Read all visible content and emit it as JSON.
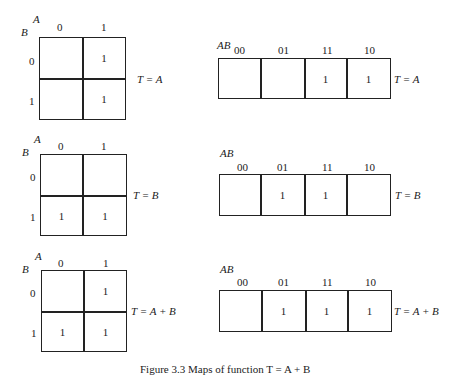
{
  "maps": [
    {
      "function": "T = A",
      "two_by_two": {
        "row_var": "B",
        "col_var": "A",
        "col_labels": [
          "0",
          "1"
        ],
        "row_labels": [
          "0",
          "1"
        ],
        "cells": [
          [
            "",
            "1"
          ],
          [
            "",
            "1"
          ]
        ]
      },
      "one_by_four": {
        "var_label": "AB",
        "col_labels": [
          "00",
          "01",
          "11",
          "10"
        ],
        "cells": [
          "",
          "",
          "1",
          "1"
        ]
      }
    },
    {
      "function": "T = B",
      "two_by_two": {
        "row_var": "B",
        "col_var": "A",
        "col_labels": [
          "0",
          "1"
        ],
        "row_labels": [
          "0",
          "1"
        ],
        "cells": [
          [
            "",
            ""
          ],
          [
            "1",
            "1"
          ]
        ]
      },
      "one_by_four": {
        "var_label": "AB",
        "col_labels": [
          "00",
          "01",
          "11",
          "10"
        ],
        "cells": [
          "",
          "1",
          "1",
          ""
        ]
      }
    },
    {
      "function": "T = A + B",
      "two_by_two": {
        "row_var": "B",
        "col_var": "A",
        "col_labels": [
          "0",
          "1"
        ],
        "row_labels": [
          "0",
          "1"
        ],
        "cells": [
          [
            "",
            "1"
          ],
          [
            "1",
            "1"
          ]
        ]
      },
      "one_by_four": {
        "var_label": "AB",
        "col_labels": [
          "00",
          "01",
          "11",
          "10"
        ],
        "cells": [
          "",
          "1",
          "1",
          "1"
        ]
      }
    }
  ],
  "caption": "Figure 3.3 Maps of function T = A + B"
}
